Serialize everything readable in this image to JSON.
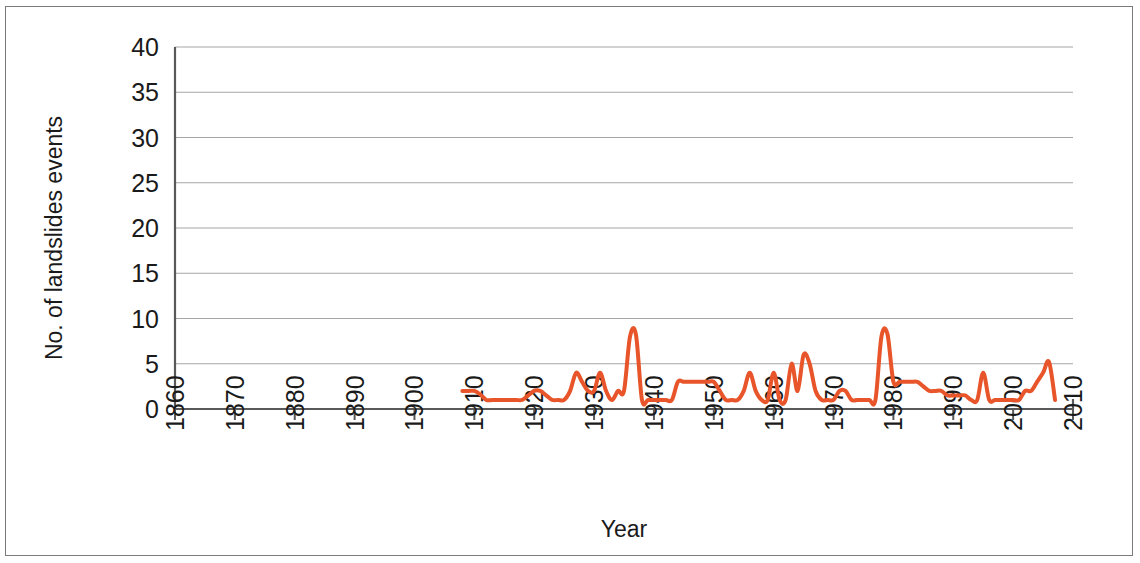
{
  "figure": {
    "background_color": "#ffffff",
    "border_color": "#7b7b7b"
  },
  "chart_data": {
    "type": "line",
    "title": "",
    "xlabel": "Year",
    "ylabel": "No. of landslides events",
    "xlim": [
      1860,
      2010
    ],
    "ylim": [
      0,
      40
    ],
    "xticks": [
      1860,
      1870,
      1880,
      1890,
      1900,
      1910,
      1920,
      1930,
      1940,
      1950,
      1960,
      1970,
      1980,
      1990,
      2000,
      2010
    ],
    "xtick_labels": [
      "1860",
      "1870",
      "1880",
      "1890",
      "1900",
      "1910",
      "1920",
      "1930",
      "1940",
      "1950",
      "1960",
      "1970",
      "1980",
      "1990",
      "2000",
      "2010"
    ],
    "yticks": [
      0,
      5,
      10,
      15,
      20,
      25,
      30,
      35,
      40
    ],
    "ytick_labels": [
      "0",
      "5",
      "10",
      "15",
      "20",
      "25",
      "30",
      "35",
      "40"
    ],
    "grid": "horizontal",
    "grid_color": "#a6a6a6",
    "axis_color": "#595959",
    "legend": null,
    "series": [
      {
        "name": "No. of landslides events",
        "color": "#e8552a",
        "line_width": 4,
        "x": [
          1908,
          1909,
          1910,
          1911,
          1912,
          1913,
          1914,
          1915,
          1916,
          1917,
          1918,
          1919,
          1920,
          1921,
          1922,
          1923,
          1924,
          1925,
          1926,
          1927,
          1928,
          1929,
          1930,
          1931,
          1932,
          1933,
          1934,
          1935,
          1936,
          1937,
          1938,
          1939,
          1940,
          1941,
          1942,
          1943,
          1944,
          1945,
          1946,
          1947,
          1948,
          1949,
          1950,
          1951,
          1952,
          1953,
          1954,
          1955,
          1956,
          1957,
          1958,
          1959,
          1960,
          1961,
          1962,
          1963,
          1964,
          1965,
          1966,
          1967,
          1968,
          1969,
          1970,
          1971,
          1972,
          1973,
          1974,
          1975,
          1976,
          1977,
          1978,
          1979,
          1980,
          1981,
          1982,
          1983,
          1984,
          1985,
          1986,
          1987,
          1988,
          1989,
          1990,
          1991,
          1992,
          1993,
          1994,
          1995,
          1996,
          1997,
          1998,
          1999,
          2000,
          2001,
          2002,
          2003,
          2004,
          2005,
          2006,
          2007
        ],
        "y": [
          2,
          2,
          2,
          1.6,
          1,
          1,
          1,
          1,
          1,
          1,
          1,
          1.5,
          2,
          2,
          1.5,
          1,
          1,
          1,
          2,
          4,
          3,
          2,
          2,
          4,
          2,
          1,
          2,
          2,
          8,
          8.2,
          1,
          1,
          1,
          1,
          1,
          1,
          3,
          3,
          3,
          3,
          3,
          3,
          3,
          2,
          1,
          1,
          1,
          2,
          4,
          2,
          1,
          1,
          4,
          1,
          1,
          5,
          2,
          6,
          5,
          2,
          1,
          1,
          1,
          2,
          2,
          1,
          1,
          1,
          1,
          1,
          8,
          8.3,
          3,
          3,
          3,
          3,
          3,
          2.5,
          2,
          2,
          2,
          1.5,
          1.5,
          1.5,
          1.5,
          1,
          1,
          4,
          1,
          1,
          1,
          1,
          1,
          1,
          2,
          2,
          3,
          4,
          5.2,
          1
        ]
      }
    ]
  }
}
